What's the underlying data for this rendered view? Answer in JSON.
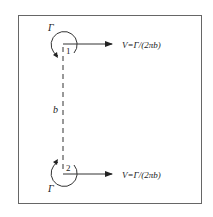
{
  "diagram": {
    "vortex1": {
      "circulation_label": "Γ",
      "index_label": "1",
      "velocity_label": "V=Γ/(2πb)"
    },
    "vortex2": {
      "circulation_label": "Γ",
      "index_label": "2",
      "velocity_label": "V=Γ/(2πb)"
    },
    "separation_label": "b"
  },
  "colors": {
    "stroke": "#333333",
    "frame": "#666666",
    "background": "#ffffff"
  }
}
